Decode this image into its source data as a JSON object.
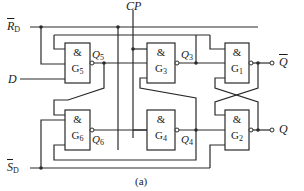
{
  "diagram": {
    "type": "circuit",
    "caption": "(a)",
    "inputs": {
      "rd": {
        "main": "R",
        "sub": "D",
        "inverted": true
      },
      "sd": {
        "main": "S",
        "sub": "D",
        "inverted": true
      },
      "d": {
        "main": "D"
      },
      "cp": {
        "main": "CP"
      }
    },
    "outputs": {
      "qbar": {
        "main": "Q",
        "inverted": true
      },
      "q": {
        "main": "Q"
      }
    },
    "gates": [
      {
        "id": "G5",
        "symbol": "&",
        "name": "G",
        "sub": "5",
        "output_label": "Q",
        "output_sub": "5"
      },
      {
        "id": "G3",
        "symbol": "&",
        "name": "G",
        "sub": "3",
        "output_label": "Q",
        "output_sub": "3"
      },
      {
        "id": "G1",
        "symbol": "&",
        "name": "G",
        "sub": "1"
      },
      {
        "id": "G6",
        "symbol": "&",
        "name": "G",
        "sub": "6",
        "output_label": "Q",
        "output_sub": "6"
      },
      {
        "id": "G4",
        "symbol": "&",
        "name": "G",
        "sub": "4",
        "output_label": "Q",
        "output_sub": "4"
      },
      {
        "id": "G2",
        "symbol": "&",
        "name": "G",
        "sub": "2"
      }
    ],
    "colors": {
      "line": "#2a2a2a",
      "background": "#ffffff"
    }
  }
}
